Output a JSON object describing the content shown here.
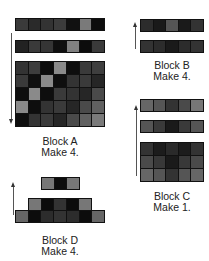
{
  "blocks": {
    "A": {
      "title": "Block A",
      "quantity": "Make 4.",
      "arrow": "down",
      "strip1": [
        "#3a3a3a",
        "#2a2a2a",
        "#333333",
        "#3c3c3c",
        "#111111",
        "#7a7a7a",
        "#0d0d0d"
      ],
      "strip2": [
        "#222222",
        "#3a3a3a",
        "#353535",
        "#0f0f0f",
        "#808080",
        "#0c0c0c",
        "#3a3a3a"
      ],
      "grid": [
        [
          "#333333",
          "#3d3d3d",
          "#0d0d0d",
          "#8a8a8a",
          "#0e0e0e",
          "#3a3a3a",
          "#3e3e3e"
        ],
        [
          "#3a3a3a",
          "#0f0f0f",
          "#8a8a8a",
          "#0e0e0e",
          "#333333",
          "#3a3a3a",
          "#262626"
        ],
        [
          "#0e0e0e",
          "#8a8a8a",
          "#0e0e0e",
          "#3a3a3a",
          "#333333",
          "#262626",
          "#4a4a4a"
        ],
        [
          "#8a8a8a",
          "#0e0e0e",
          "#333333",
          "#3a3a3a",
          "#262626",
          "#4a4a4a",
          "#606060"
        ],
        [
          "#0e0e0e",
          "#333333",
          "#3a3a3a",
          "#262626",
          "#4a4a4a",
          "#606060",
          "#7a7a7a"
        ]
      ]
    },
    "B": {
      "title": "Block B",
      "quantity": "Make 4.",
      "arrow": "up",
      "strip1": [
        "#2c2c2c",
        "#1a1a1a",
        "#555555",
        "#1a1a1a",
        "#333333"
      ],
      "strip2": [
        "#333333",
        "#2c2c2c",
        "#1a1a1a",
        "#2c2c2c",
        "#333333"
      ]
    },
    "C": {
      "title": "Block C",
      "quantity": "Make 1.",
      "arrow": "up",
      "strip1": [
        "#666666",
        "#555555",
        "#333333",
        "#4a4a4a",
        "#777777"
      ],
      "strip2": [
        "#555555",
        "#3a3a3a",
        "#1a1a1a",
        "#3a3a3a",
        "#555555"
      ],
      "grid": [
        [
          "#333333",
          "#1c1c1c",
          "#2a2a2a",
          "#1c1c1c",
          "#333333"
        ],
        [
          "#4a4a4a",
          "#383838",
          "#1a1a1a",
          "#383838",
          "#4a4a4a"
        ],
        [
          "#666666",
          "#555555",
          "#333333",
          "#555555",
          "#666666"
        ]
      ]
    },
    "D": {
      "title": "Block D",
      "quantity": "Make 4.",
      "arrow": "up",
      "top": [
        "#777777",
        "#0c0c0c",
        "#777777"
      ],
      "middle": [
        "#777777",
        "#0c0c0c",
        "#333333",
        "#0c0c0c",
        "#777777"
      ],
      "bottom": [
        "#666666",
        "#0c0c0c",
        "#2c2c2c",
        "#333333",
        "#2c2c2c",
        "#0c0c0c",
        "#666666"
      ]
    }
  }
}
